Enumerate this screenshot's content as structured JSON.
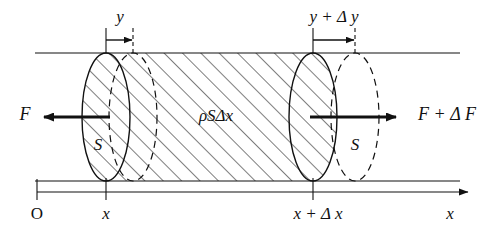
{
  "figure": {
    "kind": "physics-diagram",
    "background_color": "#ffffff",
    "line_color": "#111111"
  },
  "labels": {
    "displacement_left": "y",
    "displacement_right": "y + Δ y",
    "force_left": "F",
    "force_right": "F + Δ F",
    "mass_element": "ρSΔx",
    "area_left": "S",
    "area_right": "S",
    "origin": "O",
    "position_left": "x",
    "position_right": "x + Δ x",
    "axis": "x"
  },
  "axis": {
    "name": "x-axis",
    "origin_tick": "O",
    "ticks": [
      "x",
      "x + Δ x"
    ],
    "arrow_direction": "right",
    "axis_label": "x"
  },
  "arrows": {
    "left_force_direction": "left",
    "right_force_direction": "right",
    "left_displacement_direction": "right",
    "right_displacement_direction": "right"
  },
  "hatching": {
    "angle_degrees": 45,
    "spacing_px": 13,
    "color": "#111111"
  }
}
